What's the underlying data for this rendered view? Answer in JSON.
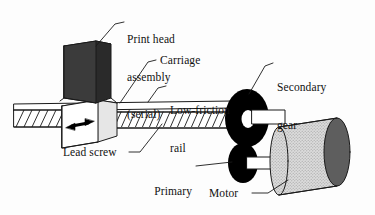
{
  "diagram": {
    "background_color": "#fdfdfd",
    "line_color": "#1a1a1a",
    "labels": {
      "print_head": "Print head\nassembly\n(serial)",
      "print_head_line1": "Print head",
      "print_head_line2": "assembly",
      "print_head_line3": "(serial)",
      "carriage": "Carriage",
      "low_friction_rail_line1": "Low-friction",
      "low_friction_rail_line2": "rail",
      "secondary_gear_line1": "Secondary",
      "secondary_gear_line2": "gear",
      "lead_screw": "Lead screw",
      "primary_gear_line1": "Primary",
      "primary_gear_line2": "gear",
      "motor": "Motor"
    },
    "parts": {
      "print_head_box": {
        "name": "print-head-box",
        "front_color": "#3b3b3b",
        "side_color": "#2a2a2a",
        "top_color": "#cfcfcf"
      },
      "carriage_box": {
        "name": "carriage-box",
        "face_color": "#ffffff",
        "top_color": "#f2f2f2",
        "side_color": "#e6e6e6"
      },
      "lead_screw": {
        "name": "lead-screw",
        "color": "#ffffff",
        "thread_count": 46
      },
      "rail": {
        "name": "low-friction-rail",
        "color": "#ffffff"
      },
      "primary_gear": {
        "name": "primary-gear",
        "color": "#000000"
      },
      "secondary_gear": {
        "name": "secondary-gear",
        "color": "#000000",
        "hub_color": "#ffffff"
      },
      "motor": {
        "name": "motor-cylinder",
        "body_color": "#d6d6d6",
        "end_cap_color": "#5e5e5e"
      },
      "motion_arrow": {
        "name": "carriage-motion-arrow",
        "color": "#000000",
        "direction": "bidirectional-horizontal"
      }
    }
  }
}
